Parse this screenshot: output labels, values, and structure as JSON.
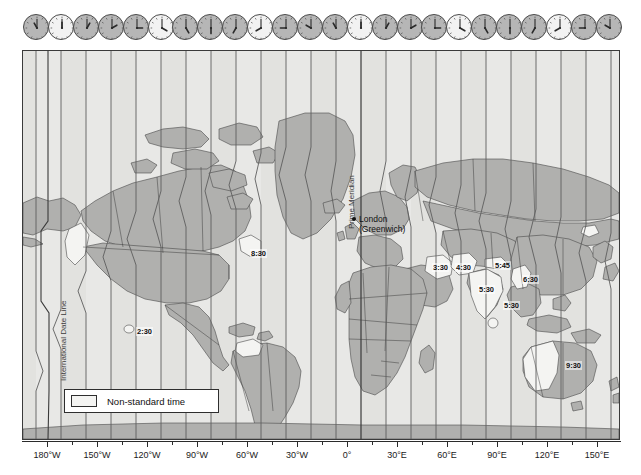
{
  "map": {
    "title": "World Time Zones",
    "projection": "cylindrical",
    "frame": {
      "x": 22,
      "y": 50,
      "width": 598,
      "height": 390
    },
    "colors": {
      "ocean": "#e8e8e6",
      "land_standard": "#b0b0ae",
      "land_nonstandard": "#f4f4f2",
      "zone_band_light": "#e9e9e7",
      "zone_band_dark": "#dedeDB",
      "zone_line": "#6e6e6e",
      "border_line": "#3a3a3a",
      "text": "#111111"
    }
  },
  "clock_strip": {
    "count": 24,
    "clocks": [
      {
        "index": 0,
        "hour": 11,
        "minute": 0,
        "shade": "dark"
      },
      {
        "index": 1,
        "hour": 12,
        "minute": 0,
        "shade": "light"
      },
      {
        "index": 2,
        "hour": 1,
        "minute": 0,
        "shade": "dark"
      },
      {
        "index": 3,
        "hour": 2,
        "minute": 0,
        "shade": "dark"
      },
      {
        "index": 4,
        "hour": 3,
        "minute": 0,
        "shade": "dark"
      },
      {
        "index": 5,
        "hour": 4,
        "minute": 0,
        "shade": "light"
      },
      {
        "index": 6,
        "hour": 5,
        "minute": 0,
        "shade": "dark"
      },
      {
        "index": 7,
        "hour": 6,
        "minute": 0,
        "shade": "dark"
      },
      {
        "index": 8,
        "hour": 7,
        "minute": 0,
        "shade": "dark"
      },
      {
        "index": 9,
        "hour": 8,
        "minute": 0,
        "shade": "light"
      },
      {
        "index": 10,
        "hour": 9,
        "minute": 0,
        "shade": "dark"
      },
      {
        "index": 11,
        "hour": 10,
        "minute": 0,
        "shade": "dark"
      },
      {
        "index": 12,
        "hour": 11,
        "minute": 0,
        "shade": "dark"
      },
      {
        "index": 13,
        "hour": 12,
        "minute": 0,
        "shade": "light"
      },
      {
        "index": 14,
        "hour": 1,
        "minute": 0,
        "shade": "dark"
      },
      {
        "index": 15,
        "hour": 2,
        "minute": 0,
        "shade": "dark"
      },
      {
        "index": 16,
        "hour": 3,
        "minute": 0,
        "shade": "dark"
      },
      {
        "index": 17,
        "hour": 4,
        "minute": 0,
        "shade": "light"
      },
      {
        "index": 18,
        "hour": 5,
        "minute": 0,
        "shade": "dark"
      },
      {
        "index": 19,
        "hour": 6,
        "minute": 0,
        "shade": "dark"
      },
      {
        "index": 20,
        "hour": 7,
        "minute": 0,
        "shade": "dark"
      },
      {
        "index": 21,
        "hour": 8,
        "minute": 0,
        "shade": "light"
      },
      {
        "index": 22,
        "hour": 9,
        "minute": 0,
        "shade": "dark"
      },
      {
        "index": 23,
        "hour": 10,
        "minute": 0,
        "shade": "dark"
      }
    ]
  },
  "axis": {
    "label": "Longitude",
    "ticks": [
      {
        "label": "180°W",
        "x": 25
      },
      {
        "label": "150°W",
        "x": 75
      },
      {
        "label": "120°W",
        "x": 125
      },
      {
        "label": "90°W",
        "x": 175
      },
      {
        "label": "60°W",
        "x": 225
      },
      {
        "label": "30°W",
        "x": 275
      },
      {
        "label": "0°",
        "x": 325
      },
      {
        "label": "30°E",
        "x": 375
      },
      {
        "label": "60°E",
        "x": 425
      },
      {
        "label": "90°E",
        "x": 475
      },
      {
        "label": "120°E",
        "x": 525
      },
      {
        "label": "150°E",
        "x": 575
      }
    ]
  },
  "annotations": {
    "international_date_line": "International Date Line",
    "prime_meridian": "Prime Meridian",
    "city": {
      "name": "London",
      "qualifier": "(Greenwich)"
    },
    "offsets": [
      {
        "label": "8:30",
        "x": 227,
        "y": 198,
        "region": "Newfoundland"
      },
      {
        "label": "2:30",
        "x": 113,
        "y": 276,
        "region": "Marquesas Islands"
      },
      {
        "label": "3:30",
        "x": 409,
        "y": 212,
        "region": "Iran"
      },
      {
        "label": "4:30",
        "x": 432,
        "y": 212,
        "region": "Afghanistan"
      },
      {
        "label": "5:45",
        "x": 471,
        "y": 210,
        "region": "Nepal"
      },
      {
        "label": "5:30",
        "x": 455,
        "y": 234,
        "region": "India"
      },
      {
        "label": "5:30",
        "x": 480,
        "y": 250,
        "region": "Sri Lanka"
      },
      {
        "label": "6:30",
        "x": 499,
        "y": 224,
        "region": "Myanmar"
      },
      {
        "label": "9:30",
        "x": 542,
        "y": 310,
        "region": "Central Australia"
      }
    ]
  },
  "legend": {
    "swatch_label": "Non-standard time"
  }
}
